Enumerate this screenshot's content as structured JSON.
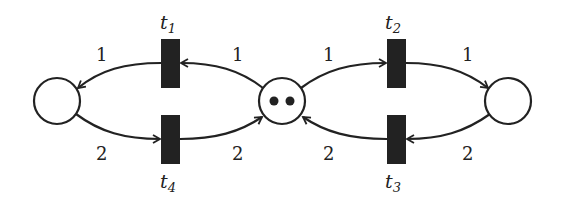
{
  "diagram": {
    "type": "petri-net",
    "places": [
      {
        "id": "p-left",
        "tokens": 0
      },
      {
        "id": "p-middle",
        "tokens": 2
      },
      {
        "id": "p-right",
        "tokens": 0
      }
    ],
    "transitions": [
      {
        "id": "t1",
        "name": "t",
        "sub": "1"
      },
      {
        "id": "t2",
        "name": "t",
        "sub": "2"
      },
      {
        "id": "t3",
        "name": "t",
        "sub": "3"
      },
      {
        "id": "t4",
        "name": "t",
        "sub": "4"
      }
    ],
    "arcs": [
      {
        "from": "p-middle",
        "to": "t1",
        "weight": "1"
      },
      {
        "from": "t1",
        "to": "p-left",
        "weight": "1"
      },
      {
        "from": "p-left",
        "to": "t4",
        "weight": "2"
      },
      {
        "from": "t4",
        "to": "p-middle",
        "weight": "2"
      },
      {
        "from": "p-middle",
        "to": "t2",
        "weight": "1"
      },
      {
        "from": "t2",
        "to": "p-right",
        "weight": "1"
      },
      {
        "from": "p-right",
        "to": "t3",
        "weight": "2"
      },
      {
        "from": "t3",
        "to": "p-middle",
        "weight": "2"
      }
    ]
  }
}
